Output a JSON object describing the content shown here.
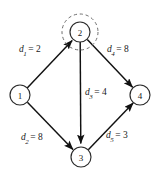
{
  "figure": {
    "type": "directed-graph"
  },
  "colors": {
    "node_stroke": "#2b2b2b",
    "node_fill": "#ffffff",
    "edge": "#111111",
    "highlight_dash": "#6e6e6e",
    "text": "#1a1a1a",
    "background": "#ffffff"
  },
  "nodes": [
    {
      "id": "1",
      "label": "1",
      "cx": 20,
      "cy": 95,
      "r": 10,
      "highlighted": false
    },
    {
      "id": "2",
      "label": "2",
      "cx": 80,
      "cy": 32,
      "r": 10,
      "highlighted": true
    },
    {
      "id": "3",
      "label": "3",
      "cx": 81,
      "cy": 157,
      "r": 10,
      "highlighted": false
    },
    {
      "id": "4",
      "label": "4",
      "cx": 140,
      "cy": 95,
      "r": 10,
      "highlighted": false
    }
  ],
  "highlight": {
    "node_id": "2",
    "style": "dashed-circle",
    "cx": 80,
    "cy": 32,
    "r": 18
  },
  "edges": [
    {
      "id": "d1",
      "from": "1",
      "to": "2",
      "symbol": "d",
      "subscript": "1",
      "equals": "=",
      "weight": "2"
    },
    {
      "id": "d2",
      "from": "1",
      "to": "3",
      "symbol": "d",
      "subscript": "2",
      "equals": "=",
      "weight": "8"
    },
    {
      "id": "d3",
      "from": "2",
      "to": "3",
      "symbol": "d",
      "subscript": "3",
      "equals": "=",
      "weight": "4"
    },
    {
      "id": "d4",
      "from": "2",
      "to": "4",
      "symbol": "d",
      "subscript": "4",
      "equals": "=",
      "weight": "8"
    },
    {
      "id": "d5",
      "from": "3",
      "to": "4",
      "symbol": "d",
      "subscript": "5",
      "equals": "=",
      "weight": "3"
    }
  ]
}
